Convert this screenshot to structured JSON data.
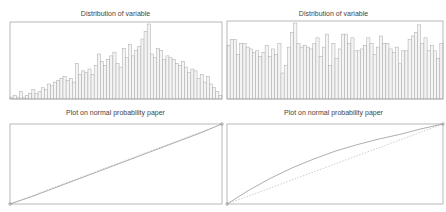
{
  "panels": {
    "top_left": {
      "title": "Distribution of variable"
    },
    "top_right": {
      "title": "Distribution of variable"
    },
    "bottom_left": {
      "title": "Plot on normal probability paper"
    },
    "bottom_right": {
      "title": "Plot on normal probability paper"
    }
  },
  "colors": {
    "axes": "#9a9a9a",
    "bar_edge": "#a8a8a8",
    "bar_fill": "#f4f4f4",
    "line": "#8a8a8a",
    "reference": "#b8b8b8"
  },
  "chart_data": [
    {
      "type": "bar",
      "title": "Distribution of variable",
      "xlabel": "",
      "ylabel": "",
      "grid": false,
      "bins": 68,
      "values": [
        1,
        2,
        1,
        4,
        1,
        2,
        3,
        5,
        3,
        4,
        6,
        5,
        8,
        7,
        9,
        10,
        11,
        12,
        10,
        11,
        9,
        19,
        13,
        15,
        14,
        16,
        13,
        18,
        24,
        20,
        18,
        21,
        23,
        25,
        19,
        17,
        27,
        22,
        29,
        23,
        26,
        28,
        32,
        36,
        40,
        24,
        22,
        27,
        26,
        21,
        23,
        22,
        21,
        19,
        18,
        20,
        17,
        14,
        16,
        15,
        11,
        13,
        9,
        12,
        8,
        6,
        4,
        2
      ]
    },
    {
      "type": "bar",
      "title": "Distribution of variable",
      "xlabel": "",
      "ylabel": "",
      "grid": false,
      "bins": 68,
      "values": [
        29,
        32,
        32,
        24,
        30,
        30,
        28,
        27,
        25,
        26,
        23,
        25,
        29,
        23,
        27,
        24,
        30,
        14,
        18,
        28,
        36,
        41,
        30,
        28,
        29,
        28,
        27,
        30,
        33,
        23,
        28,
        35,
        18,
        30,
        22,
        27,
        35,
        35,
        30,
        33,
        26,
        26,
        27,
        29,
        33,
        30,
        24,
        28,
        34,
        30,
        30,
        27,
        25,
        28,
        19,
        26,
        26,
        32,
        34,
        36,
        40,
        30,
        33,
        26,
        29,
        26,
        22,
        30
      ]
    },
    {
      "type": "line",
      "title": "Plot on normal probability paper",
      "xlabel": "",
      "ylabel": "",
      "grid": false,
      "series": [
        {
          "name": "data",
          "x": [
            0,
            0.1,
            0.2,
            0.3,
            0.4,
            0.5,
            0.6,
            0.7,
            0.8,
            0.9,
            1.0
          ],
          "y": [
            0,
            0.09,
            0.19,
            0.29,
            0.39,
            0.49,
            0.59,
            0.69,
            0.79,
            0.89,
            1.0
          ]
        },
        {
          "name": "reference",
          "x": [
            0,
            1
          ],
          "y": [
            0,
            1
          ]
        }
      ]
    },
    {
      "type": "line",
      "title": "Plot on normal probability paper",
      "xlabel": "",
      "ylabel": "",
      "grid": false,
      "series": [
        {
          "name": "data",
          "x": [
            0,
            0.1,
            0.2,
            0.3,
            0.4,
            0.5,
            0.6,
            0.7,
            0.8,
            0.9,
            1.0
          ],
          "y": [
            0,
            0.17,
            0.32,
            0.45,
            0.56,
            0.66,
            0.74,
            0.81,
            0.87,
            0.94,
            1.0
          ]
        },
        {
          "name": "reference",
          "x": [
            0,
            1
          ],
          "y": [
            0,
            1
          ]
        }
      ]
    }
  ]
}
